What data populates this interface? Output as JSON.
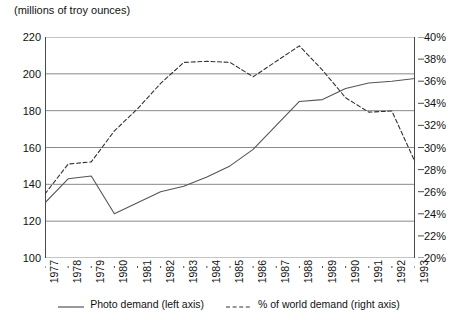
{
  "chart_data": {
    "type": "line",
    "title": "(millions of troy ounces)",
    "xlabel": "",
    "ylabel": "",
    "grid": true,
    "legend_position": "bottom",
    "x": [
      1977,
      1978,
      1979,
      1980,
      1981,
      1982,
      1983,
      1984,
      1985,
      1986,
      1987,
      1988,
      1989,
      1990,
      1991,
      1992,
      1993
    ],
    "categories": [
      "1977",
      "1978",
      "1979",
      "1980",
      "1981",
      "1982",
      "1983",
      "1984",
      "1985",
      "1986",
      "1987",
      "1988",
      "1989",
      "1990",
      "1991",
      "1992",
      "1993"
    ],
    "axes": {
      "left": {
        "label": "(millions of troy ounces)",
        "min": 100,
        "max": 220,
        "step": 20,
        "ticks": [
          "100",
          "120",
          "140",
          "160",
          "180",
          "200",
          "220"
        ]
      },
      "right": {
        "label": "",
        "min": 20,
        "max": 40,
        "step": 2,
        "ticks": [
          "20%",
          "22%",
          "24%",
          "26%",
          "28%",
          "30%",
          "32%",
          "34%",
          "36%",
          "38%",
          "40%"
        ]
      }
    },
    "series": [
      {
        "name": "Photo demand (left axis)",
        "axis": "left",
        "style": "solid",
        "color": "#555555",
        "values": [
          130,
          143,
          144.5,
          124,
          130,
          136,
          139,
          144,
          150,
          159,
          172,
          185,
          186,
          192,
          195,
          196,
          197.5
        ]
      },
      {
        "name": "% of world demand (right axis)",
        "axis": "right",
        "style": "dashed",
        "color": "#333333",
        "values": [
          25.8,
          28.5,
          28.7,
          31.5,
          33.5,
          35.8,
          37.7,
          37.8,
          37.7,
          36.4,
          37.8,
          39.2,
          37.0,
          34.5,
          33.2,
          33.3,
          28.7
        ]
      }
    ],
    "legend": [
      {
        "label": "Photo demand (left axis)",
        "style": "solid"
      },
      {
        "label": "% of world demand (right axis)",
        "style": "dashed"
      }
    ]
  },
  "colors": {
    "axis": "#4a4a4a",
    "grid": "#8a8a8a",
    "solid_series": "#555555",
    "dashed_series": "#333333",
    "background": "#ffffff"
  }
}
